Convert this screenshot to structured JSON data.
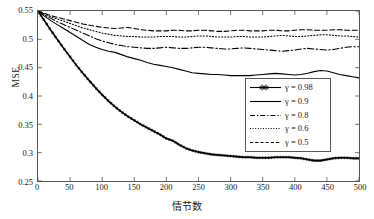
{
  "chart_data": {
    "type": "line",
    "title": "",
    "xlabel": "情节数",
    "ylabel": "MSE",
    "xlim": [
      0,
      500
    ],
    "ylim": [
      0.25,
      0.55
    ],
    "xticks": [
      "0",
      "50",
      "100",
      "150",
      "200",
      "250",
      "300",
      "350",
      "400",
      "450",
      "500"
    ],
    "xtick_values": [
      0,
      50,
      100,
      150,
      200,
      250,
      300,
      350,
      400,
      450,
      500
    ],
    "yticks": [
      "0.25",
      "0.3",
      "0.35",
      "0.4",
      "0.45",
      "0.5",
      "0.55"
    ],
    "ytick_values": [
      0.25,
      0.3,
      0.35,
      0.4,
      0.45,
      0.5,
      0.55
    ],
    "grid": false,
    "legend_position": "center-right",
    "x": [
      0,
      10,
      20,
      30,
      40,
      50,
      60,
      70,
      80,
      90,
      100,
      110,
      120,
      130,
      140,
      150,
      160,
      170,
      180,
      190,
      200,
      210,
      220,
      230,
      240,
      250,
      260,
      270,
      280,
      290,
      300,
      310,
      320,
      330,
      340,
      350,
      360,
      370,
      380,
      390,
      400,
      410,
      420,
      430,
      440,
      450,
      460,
      470,
      480,
      490,
      500
    ],
    "series": [
      {
        "name": "γ = 0.98",
        "gamma": 0.98,
        "style": "solid",
        "marker": "star",
        "color": "#000000",
        "values": [
          0.55,
          0.533,
          0.516,
          0.5,
          0.484,
          0.469,
          0.454,
          0.44,
          0.427,
          0.414,
          0.402,
          0.391,
          0.381,
          0.372,
          0.364,
          0.357,
          0.35,
          0.344,
          0.338,
          0.332,
          0.325,
          0.321,
          0.314,
          0.308,
          0.304,
          0.301,
          0.299,
          0.297,
          0.296,
          0.295,
          0.294,
          0.293,
          0.292,
          0.292,
          0.291,
          0.291,
          0.291,
          0.292,
          0.292,
          0.292,
          0.291,
          0.29,
          0.288,
          0.286,
          0.286,
          0.288,
          0.29,
          0.291,
          0.291,
          0.29,
          0.29
        ]
      },
      {
        "name": "γ = 0.9",
        "gamma": 0.9,
        "style": "solid",
        "marker": "none",
        "color": "#000000",
        "values": [
          0.55,
          0.541,
          0.533,
          0.526,
          0.519,
          0.512,
          0.505,
          0.498,
          0.491,
          0.486,
          0.482,
          0.479,
          0.477,
          0.473,
          0.469,
          0.466,
          0.463,
          0.459,
          0.456,
          0.454,
          0.452,
          0.45,
          0.447,
          0.444,
          0.441,
          0.44,
          0.439,
          0.438,
          0.438,
          0.437,
          0.436,
          0.436,
          0.436,
          0.436,
          0.437,
          0.438,
          0.439,
          0.44,
          0.439,
          0.438,
          0.437,
          0.438,
          0.44,
          0.443,
          0.445,
          0.444,
          0.441,
          0.438,
          0.436,
          0.434,
          0.432
        ]
      },
      {
        "name": "γ = 0.8",
        "gamma": 0.8,
        "style": "dashdot",
        "marker": "none",
        "color": "#000000",
        "values": [
          0.55,
          0.543,
          0.537,
          0.531,
          0.526,
          0.521,
          0.516,
          0.511,
          0.506,
          0.501,
          0.497,
          0.494,
          0.491,
          0.489,
          0.487,
          0.486,
          0.485,
          0.484,
          0.484,
          0.485,
          0.486,
          0.485,
          0.484,
          0.484,
          0.485,
          0.486,
          0.486,
          0.485,
          0.484,
          0.483,
          0.483,
          0.484,
          0.485,
          0.484,
          0.483,
          0.482,
          0.481,
          0.48,
          0.479,
          0.48,
          0.481,
          0.483,
          0.484,
          0.483,
          0.482,
          0.481,
          0.482,
          0.484,
          0.486,
          0.487,
          0.487
        ]
      },
      {
        "name": "γ = 0.6",
        "gamma": 0.6,
        "style": "dotted",
        "marker": "none",
        "color": "#000000",
        "values": [
          0.55,
          0.545,
          0.54,
          0.536,
          0.532,
          0.528,
          0.524,
          0.52,
          0.517,
          0.514,
          0.511,
          0.509,
          0.507,
          0.506,
          0.505,
          0.505,
          0.504,
          0.504,
          0.504,
          0.505,
          0.505,
          0.505,
          0.504,
          0.504,
          0.505,
          0.506,
          0.506,
          0.505,
          0.504,
          0.504,
          0.504,
          0.505,
          0.505,
          0.504,
          0.504,
          0.504,
          0.505,
          0.506,
          0.507,
          0.506,
          0.505,
          0.505,
          0.506,
          0.507,
          0.508,
          0.508,
          0.507,
          0.506,
          0.506,
          0.505,
          0.504
        ]
      },
      {
        "name": "γ = 0.5",
        "gamma": 0.5,
        "style": "dashed",
        "marker": "none",
        "color": "#000000",
        "values": [
          0.55,
          0.546,
          0.542,
          0.539,
          0.536,
          0.533,
          0.53,
          0.527,
          0.525,
          0.523,
          0.521,
          0.52,
          0.519,
          0.52,
          0.521,
          0.519,
          0.517,
          0.516,
          0.515,
          0.515,
          0.515,
          0.516,
          0.516,
          0.515,
          0.515,
          0.516,
          0.516,
          0.515,
          0.514,
          0.514,
          0.515,
          0.516,
          0.516,
          0.515,
          0.515,
          0.515,
          0.516,
          0.516,
          0.515,
          0.515,
          0.516,
          0.517,
          0.517,
          0.516,
          0.516,
          0.516,
          0.517,
          0.517,
          0.516,
          0.516,
          0.516
        ]
      }
    ]
  },
  "legend": {
    "entries": [
      {
        "label": "γ = 0.98",
        "style": "solid-star"
      },
      {
        "label": "γ = 0.9",
        "style": "solid"
      },
      {
        "label": "γ = 0.8",
        "style": "dashdot"
      },
      {
        "label": "γ = 0.6",
        "style": "dotted"
      },
      {
        "label": "γ = 0.5",
        "style": "dashed"
      }
    ]
  },
  "axes": {
    "y_title": "MSE",
    "x_title": "情节数"
  }
}
